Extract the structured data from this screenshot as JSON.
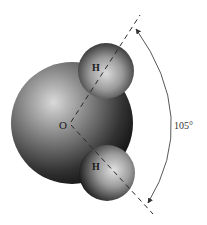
{
  "diagram": {
    "atoms": {
      "oxygen": {
        "label": "O"
      },
      "hydrogen_top": {
        "label": "H"
      },
      "hydrogen_bottom": {
        "label": "H"
      }
    },
    "bond_angle": {
      "label": "105°",
      "value": 105
    },
    "colors": {
      "sphere_dark": "#141414",
      "sphere_light": "#d8d8d8",
      "line": "#333333",
      "background": "#ffffff"
    }
  }
}
